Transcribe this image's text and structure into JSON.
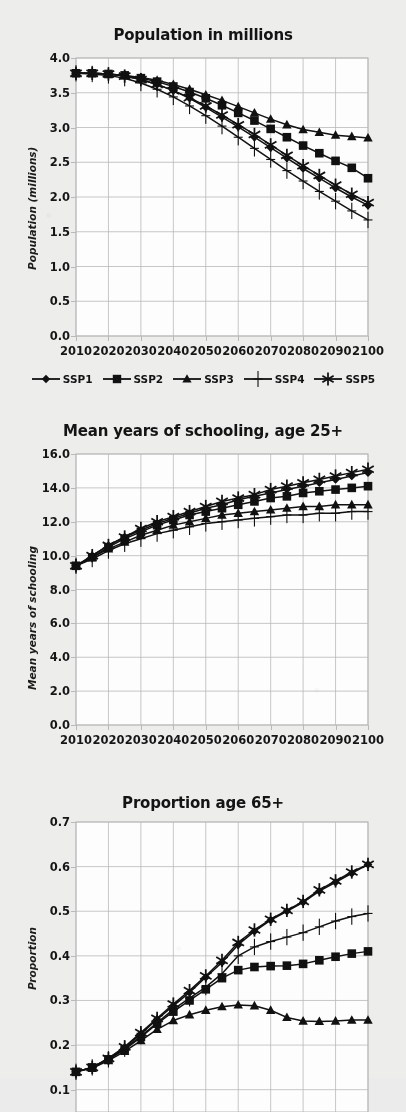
{
  "figure": {
    "background_color": "#ededeb",
    "plot_background_color": "#fdfdfd",
    "line_color": "#111111",
    "grid_color": "#b9b9b9"
  },
  "legend": {
    "position": "below-first-panel",
    "entries": [
      {
        "label": "SSP1",
        "marker": "diamond"
      },
      {
        "label": "SSP2",
        "marker": "square"
      },
      {
        "label": "SSP3",
        "marker": "triangle"
      },
      {
        "label": "SSP4",
        "marker": "plus"
      },
      {
        "label": "SSP5",
        "marker": "asterisk"
      }
    ]
  },
  "chart_data": [
    {
      "type": "line",
      "title": "Population in millions",
      "xlabel": "",
      "ylabel": "Population (millions)",
      "x": [
        2010,
        2015,
        2020,
        2025,
        2030,
        2035,
        2040,
        2045,
        2050,
        2055,
        2060,
        2065,
        2070,
        2075,
        2080,
        2085,
        2090,
        2095,
        2100
      ],
      "xlim": [
        2010,
        2100
      ],
      "ylim": [
        0.0,
        4.0
      ],
      "yticks": [
        "0.0",
        "0.5",
        "1.0",
        "1.5",
        "2.0",
        "2.5",
        "3.0",
        "3.5",
        "4.0"
      ],
      "xticks": [
        "2010",
        "2020",
        "2030",
        "2040",
        "2050",
        "2060",
        "2070",
        "2080",
        "2090",
        "2100"
      ],
      "grid": true,
      "series": [
        {
          "name": "SSP1",
          "marker": "diamond",
          "values": [
            3.78,
            3.78,
            3.77,
            3.74,
            3.69,
            3.62,
            3.53,
            3.42,
            3.29,
            3.15,
            3.01,
            2.86,
            2.71,
            2.56,
            2.41,
            2.27,
            2.13,
            2.0,
            1.88
          ]
        },
        {
          "name": "SSP2",
          "marker": "square",
          "values": [
            3.78,
            3.78,
            3.77,
            3.75,
            3.71,
            3.66,
            3.59,
            3.51,
            3.42,
            3.32,
            3.21,
            3.1,
            2.98,
            2.86,
            2.74,
            2.63,
            2.52,
            2.42,
            2.27
          ]
        },
        {
          "name": "SSP3",
          "marker": "triangle",
          "values": [
            3.78,
            3.78,
            3.77,
            3.75,
            3.72,
            3.68,
            3.62,
            3.55,
            3.47,
            3.39,
            3.3,
            3.21,
            3.12,
            3.04,
            2.97,
            2.93,
            2.89,
            2.87,
            2.85
          ]
        },
        {
          "name": "SSP4",
          "marker": "plus",
          "values": [
            3.78,
            3.77,
            3.75,
            3.71,
            3.64,
            3.55,
            3.44,
            3.31,
            3.17,
            3.02,
            2.86,
            2.7,
            2.54,
            2.38,
            2.23,
            2.08,
            1.94,
            1.8,
            1.67
          ]
        },
        {
          "name": "SSP5",
          "marker": "asterisk",
          "values": [
            3.78,
            3.78,
            3.77,
            3.74,
            3.69,
            3.62,
            3.53,
            3.43,
            3.31,
            3.18,
            3.04,
            2.9,
            2.75,
            2.6,
            2.45,
            2.31,
            2.17,
            2.04,
            1.92
          ]
        }
      ]
    },
    {
      "type": "line",
      "title": "Mean years of schooling, age 25+",
      "xlabel": "",
      "ylabel": "Mean years of schooling",
      "x": [
        2010,
        2015,
        2020,
        2025,
        2030,
        2035,
        2040,
        2045,
        2050,
        2055,
        2060,
        2065,
        2070,
        2075,
        2080,
        2085,
        2090,
        2095,
        2100
      ],
      "xlim": [
        2010,
        2100
      ],
      "ylim": [
        0.0,
        16.0
      ],
      "yticks": [
        "0.0",
        "2.0",
        "4.0",
        "6.0",
        "8.0",
        "10.0",
        "12.0",
        "14.0",
        "16.0"
      ],
      "xticks": [
        "2010",
        "2020",
        "2030",
        "2040",
        "2050",
        "2060",
        "2070",
        "2080",
        "2090",
        "2100"
      ],
      "grid": true,
      "series": [
        {
          "name": "SSP1",
          "marker": "diamond",
          "values": [
            9.4,
            10.0,
            10.6,
            11.1,
            11.5,
            11.9,
            12.2,
            12.5,
            12.8,
            13.0,
            13.3,
            13.5,
            13.7,
            13.9,
            14.1,
            14.3,
            14.5,
            14.7,
            14.9
          ]
        },
        {
          "name": "SSP2",
          "marker": "square",
          "values": [
            9.4,
            9.9,
            10.5,
            11.0,
            11.4,
            11.8,
            12.1,
            12.4,
            12.6,
            12.8,
            13.0,
            13.2,
            13.4,
            13.5,
            13.7,
            13.8,
            13.9,
            14.0,
            14.1
          ]
        },
        {
          "name": "SSP3",
          "marker": "triangle",
          "values": [
            9.4,
            9.9,
            10.4,
            10.8,
            11.2,
            11.5,
            11.8,
            12.0,
            12.2,
            12.4,
            12.5,
            12.6,
            12.7,
            12.8,
            12.9,
            12.9,
            13.0,
            13.0,
            13.0
          ]
        },
        {
          "name": "SSP4",
          "marker": "plus",
          "values": [
            9.4,
            9.8,
            10.3,
            10.7,
            11.0,
            11.3,
            11.5,
            11.7,
            11.9,
            12.0,
            12.1,
            12.2,
            12.3,
            12.4,
            12.4,
            12.5,
            12.5,
            12.6,
            12.6
          ]
        },
        {
          "name": "SSP5",
          "marker": "asterisk",
          "values": [
            9.4,
            10.0,
            10.6,
            11.1,
            11.6,
            12.0,
            12.3,
            12.6,
            12.9,
            13.2,
            13.4,
            13.6,
            13.9,
            14.1,
            14.3,
            14.5,
            14.7,
            14.9,
            15.1
          ]
        }
      ]
    },
    {
      "type": "line",
      "title": "Proportion age 65+",
      "xlabel": "",
      "ylabel": "Proportion",
      "x": [
        2010,
        2015,
        2020,
        2025,
        2030,
        2035,
        2040,
        2045,
        2050,
        2055,
        2060,
        2065,
        2070,
        2075,
        2080,
        2085,
        2090,
        2095,
        2100
      ],
      "xlim": [
        2010,
        2100
      ],
      "ylim": [
        0.05,
        0.7
      ],
      "yticks": [
        "0.1",
        "0.2",
        "0.3",
        "0.4",
        "0.5",
        "0.6",
        "0.7"
      ],
      "xticks": [],
      "grid": true,
      "note": "bottom of panel is cropped by the image edge",
      "series": [
        {
          "name": "SSP1",
          "marker": "diamond",
          "values": [
            0.14,
            0.15,
            0.17,
            0.195,
            0.225,
            0.258,
            0.288,
            0.318,
            0.352,
            0.385,
            0.425,
            0.455,
            0.48,
            0.5,
            0.52,
            0.545,
            0.565,
            0.585,
            0.605
          ]
        },
        {
          "name": "SSP2",
          "marker": "square",
          "values": [
            0.14,
            0.15,
            0.168,
            0.19,
            0.218,
            0.248,
            0.275,
            0.3,
            0.325,
            0.35,
            0.368,
            0.375,
            0.377,
            0.378,
            0.382,
            0.39,
            0.398,
            0.405,
            0.41
          ]
        },
        {
          "name": "SSP3",
          "marker": "triangle",
          "values": [
            0.14,
            0.148,
            0.165,
            0.186,
            0.21,
            0.235,
            0.255,
            0.268,
            0.278,
            0.286,
            0.29,
            0.288,
            0.278,
            0.262,
            0.254,
            0.253,
            0.254,
            0.256,
            0.256
          ]
        },
        {
          "name": "SSP4",
          "marker": "plus",
          "values": [
            0.14,
            0.15,
            0.168,
            0.192,
            0.22,
            0.25,
            0.28,
            0.305,
            0.33,
            0.36,
            0.4,
            0.42,
            0.432,
            0.442,
            0.452,
            0.465,
            0.478,
            0.488,
            0.495
          ]
        },
        {
          "name": "SSP5",
          "marker": "asterisk",
          "values": [
            0.14,
            0.15,
            0.17,
            0.196,
            0.228,
            0.26,
            0.292,
            0.322,
            0.355,
            0.39,
            0.43,
            0.458,
            0.482,
            0.502,
            0.522,
            0.548,
            0.568,
            0.588,
            0.605
          ]
        }
      ]
    }
  ]
}
